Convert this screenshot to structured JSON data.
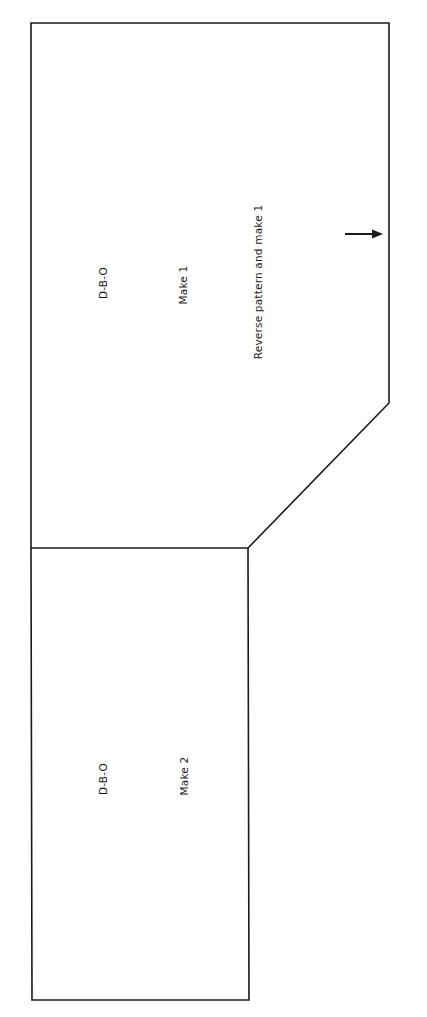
{
  "diagram": {
    "type": "sewing-pattern",
    "line_color": "#1a1a1a",
    "background": "#ffffff",
    "pieces": [
      {
        "id": "upper-piece",
        "labels": {
          "fabric": "D-B-O",
          "quantity": "Make 1",
          "instruction": "Reverse pattern and make 1"
        },
        "grain_arrow": "right"
      },
      {
        "id": "lower-piece",
        "labels": {
          "fabric": "D-B-O",
          "quantity": "Make 2"
        }
      }
    ]
  }
}
